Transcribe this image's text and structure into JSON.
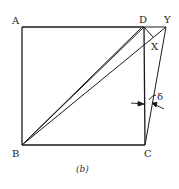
{
  "figure": {
    "caption": "(b)",
    "labels": {
      "A": "A",
      "B": "B",
      "C": "C",
      "D": "D",
      "X": "X",
      "Y": "Y",
      "delta": "δ"
    },
    "colors": {
      "line": "#1a1a1a",
      "background": "#ffffff"
    }
  }
}
